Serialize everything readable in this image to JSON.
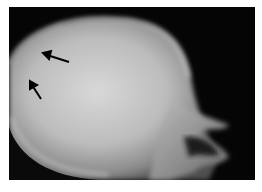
{
  "image": {
    "subject": "lateral skull radiograph",
    "background_color": "#050505",
    "annotations": [
      {
        "type": "arrow",
        "direction": "left",
        "x": 45,
        "y": 52
      },
      {
        "type": "arrow",
        "direction": "up-left",
        "x": 33,
        "y": 80
      }
    ]
  }
}
